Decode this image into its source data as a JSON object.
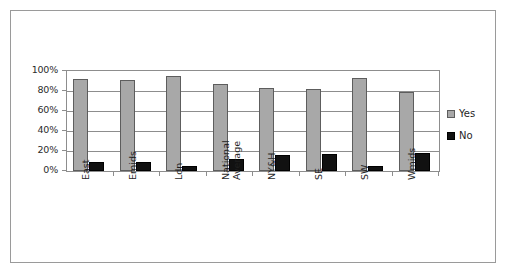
{
  "chart_data": {
    "type": "bar",
    "title": "",
    "xlabel": "",
    "ylabel": "",
    "ylim": [
      0,
      100
    ],
    "yticks": [
      "0%",
      "20%",
      "40%",
      "60%",
      "80%",
      "100%"
    ],
    "ytick_values": [
      0,
      20,
      40,
      60,
      80,
      100
    ],
    "grid": true,
    "legend_position": "right",
    "categories": [
      "East",
      "Emids",
      "Ldn",
      "National Average",
      "NY&H",
      "SE",
      "SW",
      "Wmids"
    ],
    "category_lines": [
      [
        "East"
      ],
      [
        "Emids"
      ],
      [
        "Ldn"
      ],
      [
        "National",
        "Average"
      ],
      [
        "NY&H"
      ],
      [
        "SE"
      ],
      [
        "SW"
      ],
      [
        "Wmids"
      ]
    ],
    "series": [
      {
        "name": "Yes",
        "color": "#a8a8a8",
        "values": [
          92,
          91,
          95,
          87,
          83,
          82,
          93,
          79
        ]
      },
      {
        "name": "No",
        "color": "#111111",
        "values": [
          9,
          9,
          5,
          12,
          16,
          17,
          5,
          18
        ]
      }
    ]
  },
  "legend": {
    "items": [
      {
        "label": "Yes",
        "swatch": "gray-square-swatch"
      },
      {
        "label": "No",
        "swatch": "black-square-swatch"
      }
    ]
  }
}
